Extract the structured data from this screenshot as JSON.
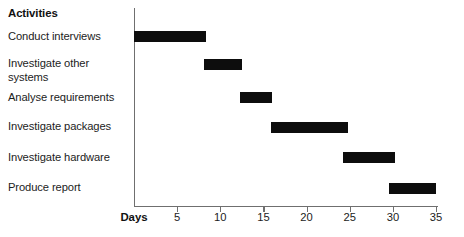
{
  "chart_data": {
    "type": "bar",
    "orientation": "horizontal",
    "subtype": "gantt",
    "title": "",
    "xlabel": "Days",
    "ylabel": "Activities",
    "xlim": [
      0,
      35
    ],
    "xticks": [
      5,
      10,
      15,
      20,
      25,
      30,
      35
    ],
    "xtick_labels": [
      "5",
      "10",
      "15",
      "20",
      "25",
      "30",
      "35"
    ],
    "grid": false,
    "legend": null,
    "categories": [
      "Conduct interviews",
      "Investigate other systems",
      "Analyse requirements",
      "Investigate packages",
      "Investigate hardware",
      "Produce report"
    ],
    "tasks": [
      {
        "label": "Conduct interviews",
        "label_lines": "Conduct interviews",
        "start": 0,
        "end": 8.3,
        "duration": 8.3
      },
      {
        "label": "Investigate other systems",
        "label_lines": "Investigate other\nsystems",
        "start": 8.1,
        "end": 12.5,
        "duration": 4.4
      },
      {
        "label": "Analyse requirements",
        "label_lines": "Analyse requirements",
        "start": 12.3,
        "end": 16.0,
        "duration": 3.7
      },
      {
        "label": "Investigate packages",
        "label_lines": "Investigate packages",
        "start": 15.9,
        "end": 24.8,
        "duration": 8.9
      },
      {
        "label": "Investigate hardware",
        "label_lines": "Investigate hardware",
        "start": 24.2,
        "end": 30.2,
        "duration": 6.0
      },
      {
        "label": "Produce report",
        "label_lines": "Produce report",
        "start": 29.5,
        "end": 35.0,
        "duration": 5.5
      }
    ],
    "colors": {
      "bar": "#0d0d0d",
      "axis": "#6f6f6f",
      "text": "#1c1c1c"
    }
  },
  "header": {
    "activities_title": "Activities"
  },
  "axis": {
    "days_label": "Days"
  }
}
